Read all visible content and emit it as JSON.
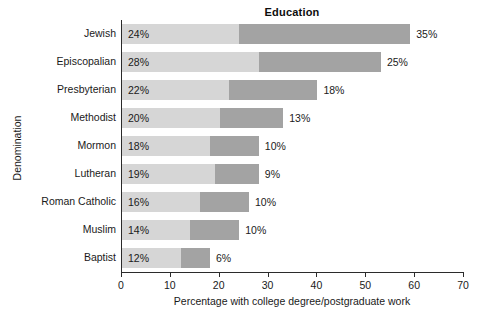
{
  "chart_data": {
    "type": "bar",
    "orientation": "horizontal",
    "stacked": true,
    "title": "Education",
    "xlabel": "Percentage with college degree/postgraduate work",
    "ylabel": "Denomination",
    "xlim": [
      0,
      70
    ],
    "xticks": [
      0,
      10,
      20,
      30,
      40,
      50,
      60,
      70
    ],
    "xtick_labels": [
      "0",
      "10",
      "20",
      "30",
      "40",
      "50",
      "60",
      "70"
    ],
    "grid": false,
    "legend": "none",
    "colors": {
      "segment_1": "#d6d6d6",
      "segment_2": "#a3a3a3",
      "axis": "#2b2b2b",
      "text": "#1a1a1a",
      "background": "#ffffff"
    },
    "categories": [
      "Jewish",
      "Episcopalian",
      "Presbyterian",
      "Methodist",
      "Mormon",
      "Lutheran",
      "Roman Catholic",
      "Muslim",
      "Baptist"
    ],
    "series": [
      {
        "name": "College degree",
        "values": [
          24,
          28,
          22,
          20,
          18,
          19,
          16,
          14,
          12
        ],
        "labels": [
          "24%",
          "28%",
          "22%",
          "20%",
          "18%",
          "19%",
          "16%",
          "14%",
          "12%"
        ]
      },
      {
        "name": "Postgraduate work",
        "values": [
          35,
          25,
          18,
          13,
          10,
          9,
          10,
          10,
          6
        ],
        "labels": [
          "35%",
          "25%",
          "18%",
          "13%",
          "10%",
          "9%",
          "10%",
          "10%",
          "6%"
        ]
      }
    ],
    "totals": [
      59,
      53,
      40,
      33,
      28,
      28,
      26,
      24,
      18
    ]
  }
}
